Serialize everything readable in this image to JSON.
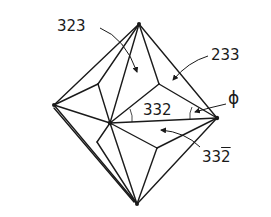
{
  "figure": {
    "labels": {
      "face_323": "323",
      "face_233": "233",
      "face_332": "332",
      "face_332bar_digits": "33",
      "face_332bar_barred": "2",
      "angle_phi": "ϕ"
    },
    "colors": {
      "line": "#1a1a1a",
      "background": "#ffffff"
    }
  }
}
